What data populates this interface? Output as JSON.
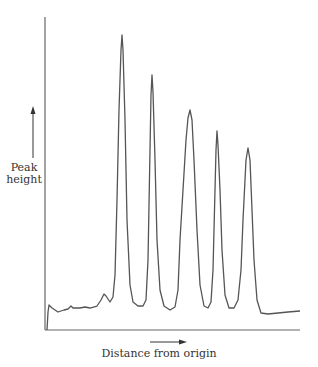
{
  "chart_data": {
    "type": "line",
    "title": "",
    "xlabel": "Distance from origin",
    "ylabel": "Peak\nheight",
    "ylabel_lines": [
      "Peak",
      "height"
    ],
    "grid": false,
    "legend": null,
    "axis_ticks": "none",
    "x_direction_arrow": true,
    "y_direction_arrow": true,
    "peaks": [
      {
        "index": 1,
        "x_rel": 0.3,
        "height_rel": 0.95
      },
      {
        "index": 2,
        "x_rel": 0.42,
        "height_rel": 0.81
      },
      {
        "index": 3,
        "x_rel": 0.57,
        "height_rel": 0.7
      },
      {
        "index": 4,
        "x_rel": 0.68,
        "height_rel": 0.63
      },
      {
        "index": 5,
        "x_rel": 0.8,
        "height_rel": 0.58
      }
    ],
    "trace_points_px": [
      [
        47,
        330
      ],
      [
        48,
        312
      ],
      [
        49,
        305
      ],
      [
        52,
        308
      ],
      [
        58,
        312
      ],
      [
        64,
        310
      ],
      [
        68,
        309
      ],
      [
        71,
        306
      ],
      [
        73,
        308
      ],
      [
        80,
        308
      ],
      [
        85,
        307
      ],
      [
        90,
        308
      ],
      [
        97,
        306
      ],
      [
        101,
        300
      ],
      [
        104,
        294
      ],
      [
        106,
        296
      ],
      [
        110,
        302
      ],
      [
        113,
        297
      ],
      [
        115,
        275
      ],
      [
        117,
        200
      ],
      [
        119,
        110
      ],
      [
        121,
        50
      ],
      [
        122,
        35
      ],
      [
        123,
        50
      ],
      [
        125,
        120
      ],
      [
        127,
        220
      ],
      [
        130,
        285
      ],
      [
        133,
        302
      ],
      [
        138,
        306
      ],
      [
        143,
        306
      ],
      [
        146,
        300
      ],
      [
        148,
        260
      ],
      [
        150,
        150
      ],
      [
        151,
        95
      ],
      [
        152,
        75
      ],
      [
        153,
        92
      ],
      [
        155,
        160
      ],
      [
        157,
        240
      ],
      [
        160,
        290
      ],
      [
        164,
        306
      ],
      [
        170,
        310
      ],
      [
        175,
        307
      ],
      [
        178,
        290
      ],
      [
        180,
        240
      ],
      [
        183,
        190
      ],
      [
        186,
        140
      ],
      [
        188,
        118
      ],
      [
        190,
        110
      ],
      [
        192,
        120
      ],
      [
        194,
        160
      ],
      [
        197,
        230
      ],
      [
        200,
        285
      ],
      [
        204,
        306
      ],
      [
        208,
        308
      ],
      [
        211,
        302
      ],
      [
        213,
        270
      ],
      [
        215,
        190
      ],
      [
        216,
        150
      ],
      [
        217,
        131
      ],
      [
        218,
        145
      ],
      [
        220,
        190
      ],
      [
        222,
        250
      ],
      [
        225,
        295
      ],
      [
        229,
        308
      ],
      [
        234,
        308
      ],
      [
        238,
        300
      ],
      [
        241,
        270
      ],
      [
        243,
        220
      ],
      [
        245,
        180
      ],
      [
        246,
        160
      ],
      [
        248,
        148
      ],
      [
        250,
        160
      ],
      [
        252,
        210
      ],
      [
        254,
        260
      ],
      [
        257,
        300
      ],
      [
        261,
        313
      ],
      [
        268,
        314
      ],
      [
        278,
        313
      ],
      [
        288,
        312
      ],
      [
        300,
        311
      ]
    ],
    "axes_px": {
      "x_axis_y": 330,
      "x_start": 45,
      "x_end": 300,
      "y_axis_x": 45,
      "y_top": 17
    }
  },
  "colors": {
    "line": "#555555",
    "axes": "#666666",
    "text": "#333333",
    "background": "#ffffff"
  }
}
